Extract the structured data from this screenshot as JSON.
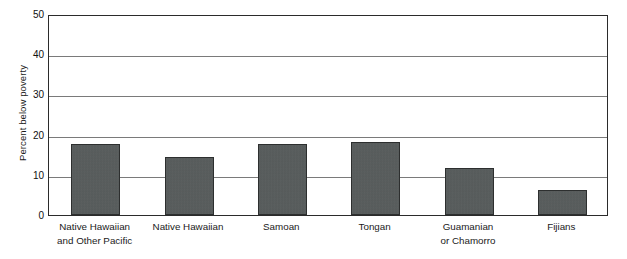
{
  "chart_data": {
    "type": "bar",
    "title": "",
    "xlabel": "",
    "ylabel": "Percent below poverty",
    "ylim": [
      0,
      50
    ],
    "yticks": [
      0,
      10,
      20,
      30,
      40,
      50
    ],
    "ytick_labels": [
      "0",
      "10",
      "20",
      "30",
      "40",
      "50"
    ],
    "grid": "horizontal",
    "legend": "none",
    "bar_color": "#575c5c",
    "bar_edge_color": "#2d2f2f",
    "frame_color": "#2b2b2b",
    "gridline_color": "#7a7a7a",
    "categories": [
      "Native Hawaiian and Other Pacific",
      "Native Hawaiian",
      "Samoan",
      "Tongan",
      "Guamanian or Chamorro",
      "Fijians"
    ],
    "category_lines": [
      [
        "Native Hawaiian",
        "and Other Pacific"
      ],
      [
        "Native Hawaiian"
      ],
      [
        "Samoan"
      ],
      [
        "Tongan"
      ],
      [
        "Guamanian",
        "or Chamorro"
      ],
      [
        "Fijians"
      ]
    ],
    "values": [
      17.7,
      14.5,
      17.6,
      18.2,
      11.6,
      6.3
    ]
  }
}
